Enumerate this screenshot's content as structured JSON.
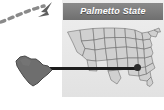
{
  "figure": {
    "panel": {
      "title": "Palmetto State",
      "title_bar_color": "#7d7d7d",
      "title_text_color": "#ffffff",
      "background_color": "#e9e9e9"
    },
    "map": {
      "name": "united-states-outline",
      "fill_color": "#d2d2d2",
      "border_color": "#6e6e6e",
      "highlighted_state": "South Carolina",
      "marker_color": "#2b2b2b"
    },
    "callout": {
      "state_name": "South Carolina",
      "state_shape_color": "#6f6f6f",
      "connector_color": "#1c1c1c"
    },
    "annotation": {
      "name": "dashed-curved-arrow",
      "points_to": "Palmetto State",
      "color": "#808080",
      "style": "dashed"
    }
  }
}
